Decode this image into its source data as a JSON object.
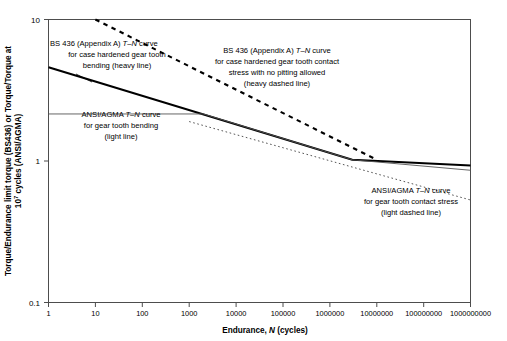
{
  "chart_data": {
    "type": "line",
    "title": "",
    "xlabel": "Endurance, N (cycles)",
    "xlabel_parts": {
      "pre": "Endurance, ",
      "ital": "N",
      "post": " (cycles)"
    },
    "ylabel": "Torque/Endurance limit torque (BS436) or Torque/Torque at 10⁷ cycles (ANSI/AGMA)",
    "ylabel_line1": "Torque/Endurance limit torque (BS436) or Torque/Torque at",
    "ylabel_line2_pre": "10",
    "ylabel_line2_sup": "7",
    "ylabel_line2_post": " cycles (ANSI/AGMA)",
    "xscale": "log",
    "yscale": "log",
    "xlim": [
      1,
      1000000000
    ],
    "ylim": [
      0.1,
      10
    ],
    "grid": false,
    "legend": "none (inline annotations)",
    "xticks": [
      "1",
      "10",
      "100",
      "1000",
      "10000",
      "100000",
      "1000000",
      "10000000",
      "100000000",
      "1000000000"
    ],
    "xtick_values": [
      1,
      10,
      100,
      1000,
      10000,
      100000,
      1000000,
      10000000,
      100000000,
      1000000000
    ],
    "yticks": [
      "10",
      "1",
      "0.1"
    ],
    "ytick_values": [
      10,
      1,
      0.1
    ],
    "series": [
      {
        "name": "BS 436 (Appendix A) T-N curve for case hardened gear tooth bending (heavy line)",
        "style": "heavy solid",
        "color": "#000000",
        "x": [
          1,
          3000000,
          1000000000
        ],
        "y": [
          4.6,
          1.02,
          0.93
        ]
      },
      {
        "name": "ANSI/AGMA T-N curve for gear tooth bending (light line)",
        "style": "light solid",
        "color": "#555555",
        "x": [
          1,
          2000,
          3000000,
          1000000000
        ],
        "y": [
          2.15,
          2.15,
          1.02,
          0.86
        ]
      },
      {
        "name": "BS 436 (Appendix A) T-N curve for case hardened gear tooth contact stress with no pitting allowed (heavy dashed line)",
        "style": "heavy dashed",
        "color": "#000000",
        "x": [
          10,
          10000000
        ],
        "y": [
          10.0,
          1.02
        ]
      },
      {
        "name": "ANSI/AGMA T-N curve for gear tooth contact stress (light dashed line)",
        "style": "light dashed",
        "color": "#555555",
        "x": [
          1000,
          1000000000
        ],
        "y": [
          1.9,
          0.53
        ]
      }
    ],
    "annotations": [
      {
        "id": "bs436-bending",
        "lines": [
          {
            "pre": "BS 436 (Appendix A) ",
            "ital": "T–N",
            "post": " curve"
          },
          {
            "pre": "for case hardened gear tooth",
            "ital": "",
            "post": ""
          },
          {
            "pre": "bending (heavy line)",
            "ital": "",
            "post": ""
          }
        ]
      },
      {
        "id": "bs436-contact",
        "lines": [
          {
            "pre": "BS 436 (Appendix A) ",
            "ital": "T–N",
            "post": " curve"
          },
          {
            "pre": "for case hardened gear tooth contact",
            "ital": "",
            "post": ""
          },
          {
            "pre": "stress with no pitting allowed",
            "ital": "",
            "post": ""
          },
          {
            "pre": "(heavy dashed line)",
            "ital": "",
            "post": ""
          }
        ]
      },
      {
        "id": "agma-bending",
        "lines": [
          {
            "pre": "ANSI/AGMA ",
            "ital": "T–N",
            "post": " curve"
          },
          {
            "pre": "for gear tooth bending",
            "ital": "",
            "post": ""
          },
          {
            "pre": "(light line)",
            "ital": "",
            "post": ""
          }
        ]
      },
      {
        "id": "agma-contact",
        "lines": [
          {
            "pre": "ANSI/AGMA ",
            "ital": "T–N",
            "post": " curve"
          },
          {
            "pre": "for gear tooth contact stress",
            "ital": "",
            "post": ""
          },
          {
            "pre": "(light dashed line)",
            "ital": "",
            "post": ""
          }
        ]
      }
    ]
  }
}
